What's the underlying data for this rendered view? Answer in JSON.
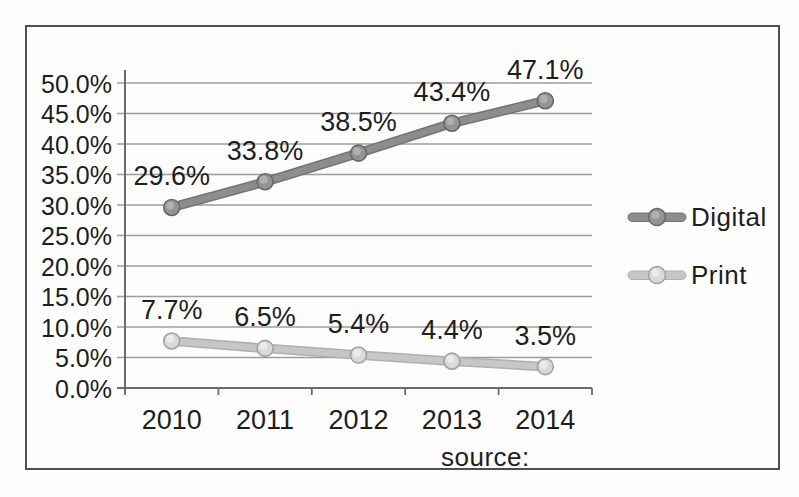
{
  "chart_data": {
    "type": "line",
    "title": "",
    "xlabel": "",
    "ylabel": "",
    "categories": [
      "2010",
      "2011",
      "2012",
      "2013",
      "2014"
    ],
    "series": [
      {
        "name": "Digital",
        "values": [
          29.6,
          33.8,
          38.5,
          43.4,
          47.1
        ],
        "point_labels": [
          "29.6%",
          "33.8%",
          "38.5%",
          "43.4%",
          "47.1%"
        ],
        "line_color": "#8d8d8d",
        "line_edge": "#747474",
        "marker_fill": "#949494",
        "marker_stroke": "#686868",
        "marker_highlight": "#b9b9b9"
      },
      {
        "name": "Print",
        "values": [
          7.7,
          6.5,
          5.4,
          4.4,
          3.5
        ],
        "point_labels": [
          "7.7%",
          "6.5%",
          "5.4%",
          "4.4%",
          "3.5%"
        ],
        "line_color": "#c6c6c6",
        "line_edge": "#afafaf",
        "marker_fill": "#d9d9d9",
        "marker_stroke": "#a2a2a2",
        "marker_highlight": "#efefef"
      }
    ],
    "ylim": [
      0,
      50
    ],
    "ytick_step": 5,
    "ytick_labels": [
      "0.0%",
      "5.0%",
      "10.0%",
      "15.0%",
      "20.0%",
      "25.0%",
      "30.0%",
      "35.0%",
      "40.0%",
      "45.0%",
      "50.0%"
    ],
    "grid": true,
    "legend_position": "right"
  },
  "source_label": "source:",
  "colors": {
    "text": "#1e1e1e",
    "grid": "#9d9d9d",
    "axis": "#6c6c6c",
    "frame_border": "#4f4f4f",
    "background": "#fdfdfd"
  }
}
